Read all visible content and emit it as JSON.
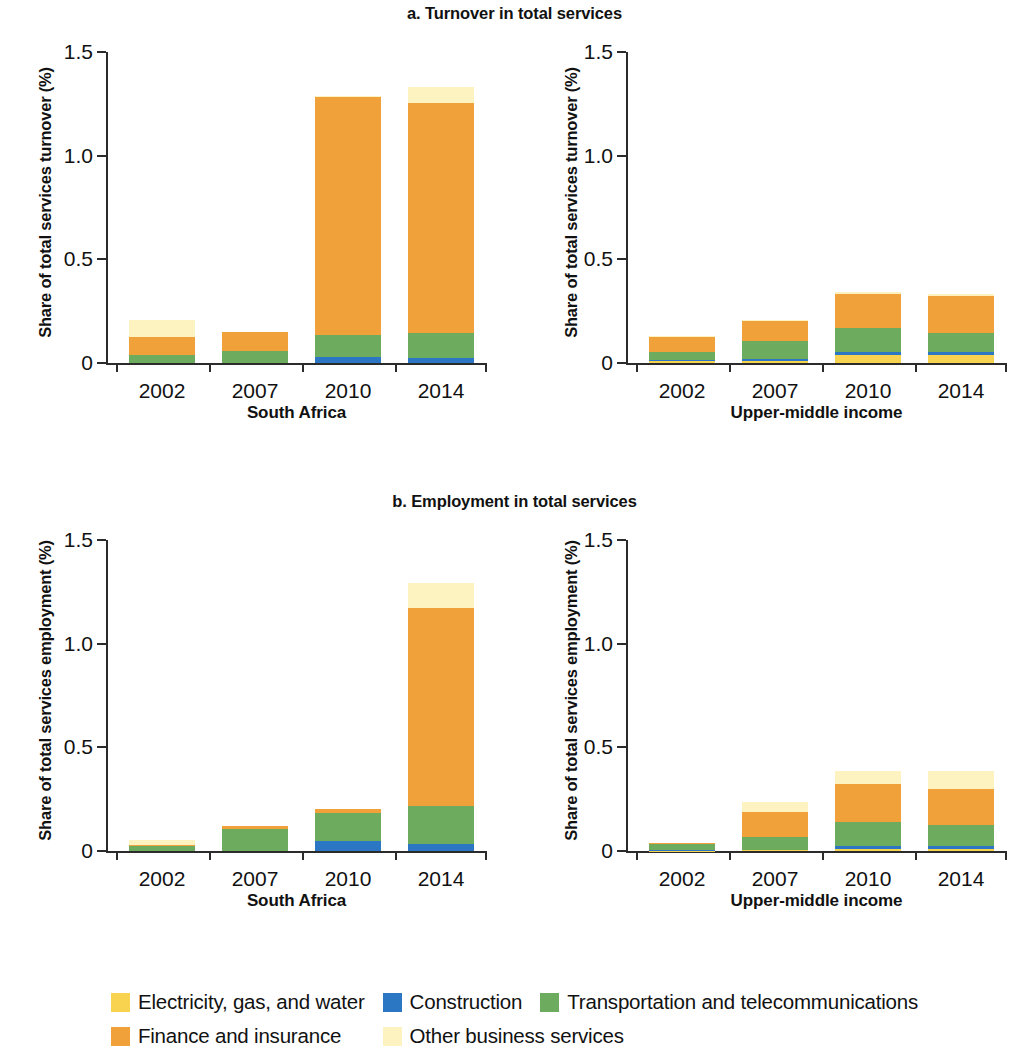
{
  "figure": {
    "panel_a_title": "a. Turnover in total services",
    "panel_b_title": "b. Employment in total services"
  },
  "legend": {
    "items": [
      {
        "label": "Electricity, gas, and water",
        "color": "#F8D34F",
        "key": "electricity"
      },
      {
        "label": "Construction",
        "color": "#2C77C4",
        "key": "construction"
      },
      {
        "label": "Transportation and telecommunications",
        "color": "#6DAB5E",
        "key": "transportation"
      },
      {
        "label": "Finance and insurance",
        "color": "#F0A13A",
        "key": "finance"
      },
      {
        "label": "Other business services",
        "color": "#FCF3C0",
        "key": "other_business"
      }
    ]
  },
  "chart_data": [
    {
      "id": "a1",
      "type": "bar",
      "stacked": true,
      "title": "a. Turnover in total services",
      "group_label": "South Africa",
      "ylabel": "Share of total services turnover (%)",
      "xlabel": "",
      "ylim": [
        0,
        1.5
      ],
      "yticks": [
        0,
        0.5,
        1.0,
        1.5
      ],
      "ytick_labels": [
        "0",
        "0.5",
        "1.0",
        "1.5"
      ],
      "categories": [
        "2002",
        "2007",
        "2010",
        "2014"
      ],
      "grid": false,
      "legend_position": "bottom",
      "series": [
        {
          "name": "Electricity, gas, and water",
          "color": "#F8D34F",
          "values": [
            0.0,
            0.0,
            0.0,
            0.0
          ]
        },
        {
          "name": "Construction",
          "color": "#2C77C4",
          "values": [
            0.0,
            0.0,
            0.03,
            0.025
          ]
        },
        {
          "name": "Transportation and telecommunications",
          "color": "#6DAB5E",
          "values": [
            0.04,
            0.06,
            0.105,
            0.12
          ]
        },
        {
          "name": "Finance and insurance",
          "color": "#F0A13A",
          "values": [
            0.085,
            0.09,
            1.15,
            1.11
          ]
        },
        {
          "name": "Other business services",
          "color": "#FCF3C0",
          "values": [
            0.085,
            0.0,
            0.005,
            0.075
          ]
        }
      ],
      "totals": [
        0.21,
        0.15,
        1.29,
        1.33
      ]
    },
    {
      "id": "a2",
      "type": "bar",
      "stacked": true,
      "title": "a. Turnover in total services",
      "group_label": "Upper-middle income",
      "ylabel": "Share of total services turnover (%)",
      "xlabel": "",
      "ylim": [
        0,
        1.5
      ],
      "yticks": [
        0,
        0.5,
        1.0,
        1.5
      ],
      "ytick_labels": [
        "0",
        "0.5",
        "1.0",
        "1.5"
      ],
      "categories": [
        "2002",
        "2007",
        "2010",
        "2014"
      ],
      "grid": false,
      "legend_position": "bottom",
      "series": [
        {
          "name": "Electricity, gas, and water",
          "color": "#F8D34F",
          "values": [
            0.008,
            0.012,
            0.04,
            0.04
          ]
        },
        {
          "name": "Construction",
          "color": "#2C77C4",
          "values": [
            0.005,
            0.008,
            0.012,
            0.012
          ]
        },
        {
          "name": "Transportation and telecommunications",
          "color": "#6DAB5E",
          "values": [
            0.042,
            0.085,
            0.115,
            0.095
          ]
        },
        {
          "name": "Finance and insurance",
          "color": "#F0A13A",
          "values": [
            0.07,
            0.1,
            0.165,
            0.175
          ]
        },
        {
          "name": "Other business services",
          "color": "#FCF3C0",
          "values": [
            0.005,
            0.005,
            0.012,
            0.01
          ]
        }
      ],
      "totals": [
        0.13,
        0.21,
        0.344,
        0.332
      ]
    },
    {
      "id": "b1",
      "type": "bar",
      "stacked": true,
      "title": "b. Employment in total services",
      "group_label": "South Africa",
      "ylabel": "Share of total services employment (%)",
      "xlabel": "",
      "ylim": [
        0,
        1.5
      ],
      "yticks": [
        0,
        0.5,
        1.0,
        1.5
      ],
      "ytick_labels": [
        "0",
        "0.5",
        "1.0",
        "1.5"
      ],
      "categories": [
        "2002",
        "2007",
        "2010",
        "2014"
      ],
      "grid": false,
      "legend_position": "bottom",
      "series": [
        {
          "name": "Electricity, gas, and water",
          "color": "#F8D34F",
          "values": [
            0.0,
            0.0,
            0.0,
            0.0
          ]
        },
        {
          "name": "Construction",
          "color": "#2C77C4",
          "values": [
            0.0,
            0.0,
            0.05,
            0.035
          ]
        },
        {
          "name": "Transportation and telecommunications",
          "color": "#6DAB5E",
          "values": [
            0.025,
            0.105,
            0.135,
            0.18
          ]
        },
        {
          "name": "Finance and insurance",
          "color": "#F0A13A",
          "values": [
            0.005,
            0.015,
            0.02,
            0.955
          ]
        },
        {
          "name": "Other business services",
          "color": "#FCF3C0",
          "values": [
            0.025,
            0.0,
            0.0,
            0.125
          ]
        }
      ],
      "totals": [
        0.055,
        0.12,
        0.205,
        1.295
      ]
    },
    {
      "id": "b2",
      "type": "bar",
      "stacked": true,
      "title": "b. Employment in total services",
      "group_label": "Upper-middle income",
      "ylabel": "Share of total services employment (%)",
      "xlabel": "",
      "ylim": [
        0,
        1.5
      ],
      "yticks": [
        0,
        0.5,
        1.0,
        1.5
      ],
      "ytick_labels": [
        "0",
        "0.5",
        "1.0",
        "1.5"
      ],
      "categories": [
        "2002",
        "2007",
        "2010",
        "2014"
      ],
      "grid": false,
      "legend_position": "bottom",
      "series": [
        {
          "name": "Electricity, gas, and water",
          "color": "#F8D34F",
          "values": [
            0.002,
            0.004,
            0.012,
            0.012
          ]
        },
        {
          "name": "Construction",
          "color": "#2C77C4",
          "values": [
            0.002,
            0.003,
            0.012,
            0.012
          ]
        },
        {
          "name": "Transportation and telecommunications",
          "color": "#6DAB5E",
          "values": [
            0.03,
            0.062,
            0.115,
            0.102
          ]
        },
        {
          "name": "Finance and insurance",
          "color": "#F0A13A",
          "values": [
            0.006,
            0.118,
            0.185,
            0.175
          ]
        },
        {
          "name": "Other business services",
          "color": "#FCF3C0",
          "values": [
            0.0,
            0.048,
            0.06,
            0.085
          ]
        }
      ],
      "totals": [
        0.04,
        0.235,
        0.384,
        0.386
      ]
    }
  ]
}
